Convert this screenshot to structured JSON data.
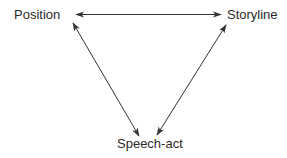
{
  "diagram": {
    "type": "triangle-relationship",
    "nodes": [
      {
        "id": "position",
        "label": "Position"
      },
      {
        "id": "storyline",
        "label": "Storyline"
      },
      {
        "id": "speech_act",
        "label": "Speech-act"
      }
    ],
    "edges": [
      {
        "from": "position",
        "to": "storyline",
        "direction": "bidirectional"
      },
      {
        "from": "position",
        "to": "speech_act",
        "direction": "bidirectional"
      },
      {
        "from": "storyline",
        "to": "speech_act",
        "direction": "bidirectional"
      }
    ],
    "colors": {
      "line": "#333333",
      "text": "#2a2a2a",
      "background": "#ffffff"
    }
  }
}
